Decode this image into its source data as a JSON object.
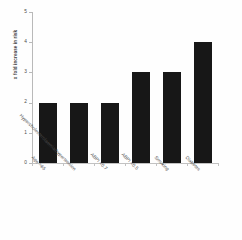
{
  "chart_data": {
    "type": "bar",
    "title": "",
    "xlabel": "",
    "ylabel": "x fold increase in risk",
    "ylim": [
      0,
      5
    ],
    "ytick_labels": [
      "0",
      "1",
      "2",
      "3",
      "4",
      "5"
    ],
    "ytick_values": [
      0,
      1,
      2,
      3,
      4,
      5
    ],
    "grid": false,
    "legend": false,
    "bar_color": "#171717",
    "background_color": "#fefefe",
    "axis_color": "#b9b9b9",
    "categories": [
      "Age >65",
      "Hypercholesterolaemia/hypertension",
      "ABPI <0.7",
      "ABPI <0.5",
      "Smoking",
      "Diabetes"
    ],
    "values": [
      2,
      2,
      2,
      3,
      3,
      4
    ]
  }
}
